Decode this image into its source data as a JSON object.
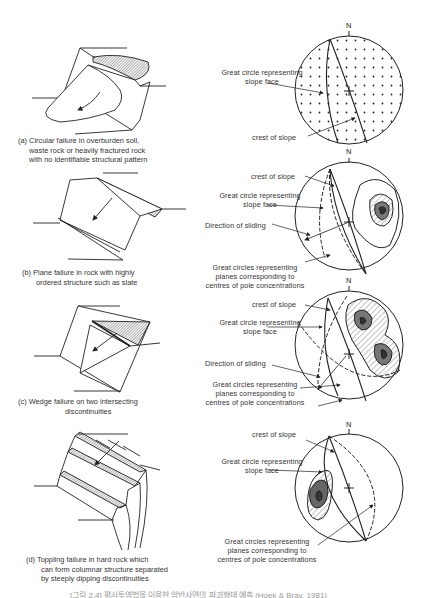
{
  "figure": {
    "panels": [
      {
        "id": "a",
        "caption_lines": [
          "(a) Circular failure in overburden soil,",
          "waste rock or heavily fractured rock",
          "with no identifiable structural pattern"
        ],
        "stereonet": {
          "north_label": "N",
          "labels": {
            "great_circle": [
              "Great circle representing",
              "slope face"
            ],
            "crest": "crest of slope"
          }
        }
      },
      {
        "id": "b",
        "caption_lines": [
          "(b) Plane failure in rock with highly",
          "ordered structure such as slate"
        ],
        "stereonet": {
          "north_label": "N",
          "labels": {
            "crest": "crest of slope",
            "great_circle": [
              "Great circle representing",
              "slope face"
            ],
            "sliding": "Direction of sliding",
            "pole_circles": [
              "Great circles representing",
              "planes corresponding to",
              "centres of pole concentrations"
            ]
          }
        }
      },
      {
        "id": "c",
        "caption_lines": [
          "(c) Wedge failure on two intersecting",
          "discontinuities"
        ],
        "stereonet": {
          "north_label": "N",
          "labels": {
            "crest": "crest of slope",
            "great_circle": [
              "Great circle representing",
              "slope face"
            ],
            "sliding": "Direction of sliding",
            "pole_circles": [
              "Great circles representing",
              "planes corresponding to",
              "centres of pole concentrations"
            ]
          }
        }
      },
      {
        "id": "d",
        "caption_lines": [
          "(d) Toppling failure in hard rock which",
          "can form columnar structure separated",
          "by steeply dipping discontinuities"
        ],
        "stereonet": {
          "north_label": "N",
          "labels": {
            "crest": "crest of slope",
            "great_circle": [
              "Great circle representing",
              "slope face"
            ],
            "pole_circles": [
              "Great circles representing",
              "planes corresponding to",
              "centres of pole concentrations"
            ]
          }
        }
      }
    ],
    "bottom_caption_cropped": "[그림 2.4] 평사투영법을 이용한 암반사면의 파괴형태 예측 (Hoek & Bray, 1981)"
  }
}
